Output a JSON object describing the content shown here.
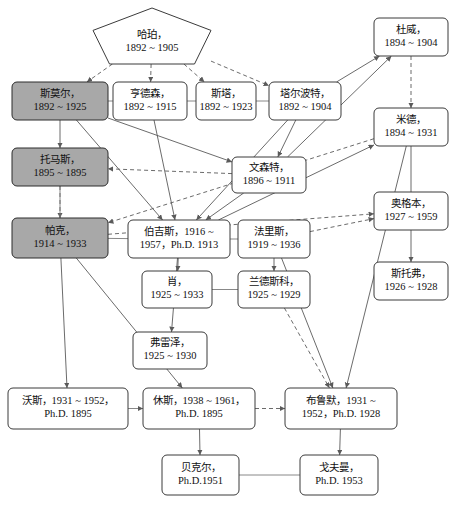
{
  "diagram": {
    "colors": {
      "shaded_fill": "#a8a8a8",
      "plain_fill": "#ffffff",
      "stroke": "#3b3b3b",
      "edge": "#5a5a5a"
    },
    "nodes": [
      {
        "id": "haper",
        "shape": "pentagon",
        "shaded": false,
        "x": 93,
        "y": 8,
        "w": 118,
        "h": 56,
        "lines": [
          "哈珀，",
          "1892 ~ 1905"
        ]
      },
      {
        "id": "small",
        "shape": "rect",
        "shaded": true,
        "x": 12,
        "y": 82,
        "w": 96,
        "h": 38,
        "lines": [
          "斯莫尔，",
          "1892 ~ 1925"
        ]
      },
      {
        "id": "henderson",
        "shape": "rect",
        "shaded": false,
        "x": 113,
        "y": 82,
        "w": 74,
        "h": 38,
        "lines": [
          "亨德森，",
          "1892 ~ 1915"
        ]
      },
      {
        "id": "starr",
        "shape": "rect",
        "shaded": false,
        "x": 196,
        "y": 82,
        "w": 60,
        "h": 38,
        "lines": [
          "斯塔，",
          "1892 ~ 1923"
        ]
      },
      {
        "id": "talbot",
        "shape": "rect",
        "shaded": false,
        "x": 269,
        "y": 82,
        "w": 72,
        "h": 38,
        "lines": [
          "塔尔波特，",
          "1892 ~ 1904"
        ]
      },
      {
        "id": "dewey",
        "shape": "rect",
        "shaded": false,
        "x": 374,
        "y": 18,
        "w": 74,
        "h": 38,
        "lines": [
          "杜威，",
          "1894 ~ 1904"
        ]
      },
      {
        "id": "mead",
        "shape": "rect",
        "shaded": false,
        "x": 374,
        "y": 108,
        "w": 74,
        "h": 38,
        "lines": [
          "米德，",
          "1894 ~ 1931"
        ]
      },
      {
        "id": "ogburn",
        "shape": "rect",
        "shaded": false,
        "x": 374,
        "y": 192,
        "w": 74,
        "h": 38,
        "lines": [
          "奥格本，",
          "1927 ~ 1959"
        ]
      },
      {
        "id": "stouffer",
        "shape": "rect",
        "shaded": false,
        "x": 374,
        "y": 262,
        "w": 74,
        "h": 38,
        "lines": [
          "斯托弗，",
          "1926 ~ 1928"
        ]
      },
      {
        "id": "thomas",
        "shape": "rect",
        "shaded": true,
        "x": 12,
        "y": 148,
        "w": 96,
        "h": 38,
        "lines": [
          "托马斯，",
          "1895 ~ 1895"
        ]
      },
      {
        "id": "vincent",
        "shape": "rect",
        "shaded": false,
        "x": 232,
        "y": 157,
        "w": 74,
        "h": 36,
        "lines": [
          "文森特，",
          "1896 ~ 1911"
        ]
      },
      {
        "id": "park",
        "shape": "rect",
        "shaded": true,
        "x": 12,
        "y": 218,
        "w": 96,
        "h": 40,
        "lines": [
          "帕克，",
          "1914 ~ 1933"
        ]
      },
      {
        "id": "burgess",
        "shape": "rect",
        "shaded": false,
        "x": 128,
        "y": 220,
        "w": 102,
        "h": 38,
        "lines": [
          "伯吉斯，1916 ~",
          "1957，Ph.D. 1913"
        ]
      },
      {
        "id": "faris",
        "shape": "rect",
        "shaded": false,
        "x": 238,
        "y": 220,
        "w": 72,
        "h": 38,
        "lines": [
          "法里斯，",
          "1919 ~ 1936"
        ]
      },
      {
        "id": "shaw",
        "shape": "rect",
        "shaded": false,
        "x": 142,
        "y": 271,
        "w": 70,
        "h": 37,
        "lines": [
          "肖，",
          "1925 ~ 1933"
        ]
      },
      {
        "id": "landesco",
        "shape": "rect",
        "shaded": false,
        "x": 238,
        "y": 271,
        "w": 72,
        "h": 37,
        "lines": [
          "兰德斯科，",
          "1925 ~ 1929"
        ]
      },
      {
        "id": "frazier",
        "shape": "rect",
        "shaded": false,
        "x": 133,
        "y": 332,
        "w": 74,
        "h": 37,
        "lines": [
          "弗雷泽，",
          "1925 ~ 1930"
        ]
      },
      {
        "id": "wirth",
        "shape": "rect",
        "shaded": false,
        "x": 8,
        "y": 388,
        "w": 120,
        "h": 41,
        "lines": [
          "沃斯，1931 ~ 1952，",
          "Ph.D. 1895"
        ]
      },
      {
        "id": "hughes",
        "shape": "rect",
        "shaded": false,
        "x": 143,
        "y": 388,
        "w": 112,
        "h": 41,
        "lines": [
          "休斯，1938 ~ 1961，",
          "Ph.D. 1895"
        ]
      },
      {
        "id": "blumer",
        "shape": "rect",
        "shaded": false,
        "x": 285,
        "y": 388,
        "w": 112,
        "h": 41,
        "lines": [
          "布鲁默，1931 ~",
          "1952，Ph.D. 1928"
        ]
      },
      {
        "id": "becker",
        "shape": "rect",
        "shaded": false,
        "x": 162,
        "y": 455,
        "w": 77,
        "h": 40,
        "lines": [
          "贝克尔，",
          "Ph.D.1951"
        ]
      },
      {
        "id": "goffman",
        "shape": "rect",
        "shaded": false,
        "x": 300,
        "y": 455,
        "w": 78,
        "h": 40,
        "lines": [
          "戈夫曼，",
          "Ph.D. 1953"
        ]
      }
    ],
    "edges": [
      {
        "from": "haper",
        "to": "small",
        "style": "dashed",
        "arrow": true
      },
      {
        "from": "haper",
        "to": "henderson",
        "style": "dashed",
        "arrow": true
      },
      {
        "from": "haper",
        "to": "starr",
        "style": "dashed",
        "arrow": true
      },
      {
        "from": "haper",
        "to": "talbot",
        "style": "dashed",
        "arrow": true
      },
      {
        "from": "small",
        "to": "thomas",
        "style": "solid",
        "arrow": true
      },
      {
        "from": "thomas",
        "to": "park",
        "style": "dashed",
        "arrow": true
      },
      {
        "from": "small",
        "to": "henderson",
        "style": "plain",
        "arrow": false
      },
      {
        "from": "henderson",
        "to": "starr",
        "style": "plain",
        "arrow": false
      },
      {
        "from": "starr",
        "to": "talbot",
        "style": "plain",
        "arrow": false
      },
      {
        "from": "dewey",
        "to": "mead",
        "style": "dashed",
        "arrow": true
      },
      {
        "from": "mead",
        "to": "ogburn",
        "style": "solid",
        "arrow": false
      },
      {
        "from": "ogburn",
        "to": "stouffer",
        "style": "solid",
        "arrow": true
      },
      {
        "from": "small",
        "to": "burgess",
        "style": "solid",
        "arrow": true
      },
      {
        "from": "henderson",
        "to": "burgess",
        "style": "solid",
        "arrow": true
      },
      {
        "from": "talbot",
        "to": "burgess",
        "style": "solid",
        "arrow": true
      },
      {
        "from": "vincent",
        "to": "burgess",
        "style": "solid",
        "arrow": true
      },
      {
        "from": "burgess",
        "to": "shaw",
        "style": "solid",
        "arrow": true
      },
      {
        "from": "faris",
        "to": "landesco",
        "style": "solid",
        "arrow": true
      },
      {
        "from": "shaw",
        "to": "landesco",
        "style": "plain",
        "arrow": false
      },
      {
        "from": "burgess",
        "to": "faris",
        "style": "plain",
        "arrow": false
      },
      {
        "from": "park",
        "to": "burgess",
        "style": "plain",
        "arrow": false
      },
      {
        "from": "burgess",
        "to": "frazier",
        "style": "solid",
        "arrow": true
      },
      {
        "from": "park",
        "to": "wirth",
        "style": "solid",
        "arrow": true
      },
      {
        "from": "park",
        "to": "hughes",
        "style": "solid",
        "arrow": true
      },
      {
        "from": "wirth",
        "to": "hughes",
        "style": "plain",
        "arrow": true
      },
      {
        "from": "hughes",
        "to": "blumer",
        "style": "dashed",
        "arrow": true
      },
      {
        "from": "hughes",
        "to": "becker",
        "style": "solid",
        "arrow": true
      },
      {
        "from": "blumer",
        "to": "goffman",
        "style": "solid",
        "arrow": true
      },
      {
        "from": "becker",
        "to": "goffman",
        "style": "plain",
        "arrow": false
      },
      {
        "from": "mead",
        "to": "blumer",
        "style": "solid",
        "arrow": true
      },
      {
        "from": "faris",
        "to": "blumer",
        "style": "solid",
        "arrow": true
      },
      {
        "from": "landesco",
        "to": "blumer",
        "style": "dashed",
        "arrow": true
      },
      {
        "from": "small",
        "to": "vincent",
        "style": "solid",
        "arrow": true
      },
      {
        "from": "talbot",
        "to": "vincent",
        "style": "solid",
        "arrow": true
      },
      {
        "from": "vincent",
        "to": "thomas",
        "style": "dashed",
        "arrow": true
      },
      {
        "from": "park",
        "to": "thomas",
        "style": "plain",
        "arrow": false
      },
      {
        "from": "mead",
        "to": "park",
        "style": "dashed",
        "arrow": true
      },
      {
        "from": "talbot",
        "to": "dewey",
        "style": "solid",
        "arrow": true
      },
      {
        "from": "vincent",
        "to": "dewey",
        "style": "solid",
        "arrow": true
      },
      {
        "from": "burgess",
        "to": "mead",
        "style": "solid",
        "arrow": true
      },
      {
        "from": "park",
        "to": "ogburn",
        "style": "dashed",
        "arrow": true
      },
      {
        "from": "faris",
        "to": "ogburn",
        "style": "dashed",
        "arrow": true
      }
    ]
  }
}
